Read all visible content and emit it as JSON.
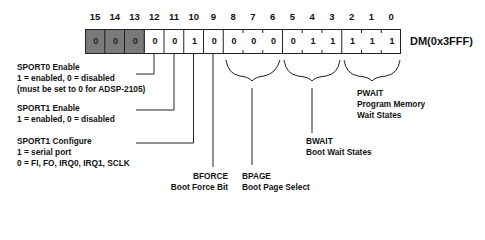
{
  "register": {
    "name": "DM(0x3FFF)",
    "bits": [
      {
        "num": "15",
        "value": "0",
        "shaded": true
      },
      {
        "num": "14",
        "value": "0",
        "shaded": true
      },
      {
        "num": "13",
        "value": "0",
        "shaded": true
      },
      {
        "num": "12",
        "value": "0",
        "shaded": false
      },
      {
        "num": "11",
        "value": "0",
        "shaded": false
      },
      {
        "num": "10",
        "value": "1",
        "shaded": false
      },
      {
        "num": "9",
        "value": "0",
        "shaded": false
      },
      {
        "num": "8",
        "value": "0",
        "shaded": false
      },
      {
        "num": "7",
        "value": "0",
        "shaded": false
      },
      {
        "num": "6",
        "value": "0",
        "shaded": false
      },
      {
        "num": "5",
        "value": "0",
        "shaded": false
      },
      {
        "num": "4",
        "value": "1",
        "shaded": false
      },
      {
        "num": "3",
        "value": "1",
        "shaded": false
      },
      {
        "num": "2",
        "value": "1",
        "shaded": false
      },
      {
        "num": "1",
        "value": "1",
        "shaded": false
      },
      {
        "num": "0",
        "value": "1",
        "shaded": false
      }
    ]
  },
  "fields": {
    "sport0": {
      "title": "SPORT0 Enable",
      "line1": "1 = enabled, 0 = disabled",
      "line2": "(must be set to 0 for ADSP-2105)"
    },
    "sport1_enable": {
      "title": "SPORT1 Enable",
      "line1": "1 = enabled, 0 = disabled"
    },
    "sport1_config": {
      "title": "SPORT1 Configure",
      "line1": "1 = serial port",
      "line2": "0 = FI, FO, IRQ0, IRQ1, SCLK"
    },
    "bforce": {
      "title": "BFORCE",
      "line1": "Boot Force Bit"
    },
    "bpage": {
      "title": "BPAGE",
      "line1": "Boot Page Select"
    },
    "bwait": {
      "title": "BWAIT",
      "line1": "Boot Wait States"
    },
    "pwait": {
      "title": "PWAIT",
      "line1": "Program Memory",
      "line2": "Wait States"
    }
  }
}
